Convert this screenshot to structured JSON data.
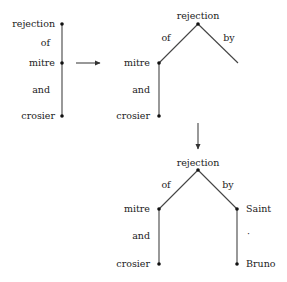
{
  "diagram": {
    "type": "dependency-tree-transformation",
    "stage1": {
      "labels": {
        "head": "rejection",
        "rel1": "of",
        "mid": "mitre",
        "rel2": "and",
        "leaf": "crosier"
      }
    },
    "stage2": {
      "labels": {
        "head": "rejection",
        "rel_left": "of",
        "rel_right": "by",
        "left_mid": "mitre",
        "left_rel": "and",
        "left_leaf": "crosier"
      }
    },
    "stage3": {
      "labels": {
        "head": "rejection",
        "rel_left": "of",
        "rel_right": "by",
        "left_mid": "mitre",
        "left_rel": "and",
        "left_leaf": "crosier",
        "right_mid": "Saint",
        "right_rel": "·",
        "right_leaf": "Bruno"
      }
    },
    "arrows": {
      "stage1_to_stage2": "right-arrow",
      "stage2_to_stage3": "down-arrow"
    },
    "colors": {
      "line": "#444444",
      "node": "#111111",
      "text": "#222222",
      "background": "#ffffff"
    }
  }
}
